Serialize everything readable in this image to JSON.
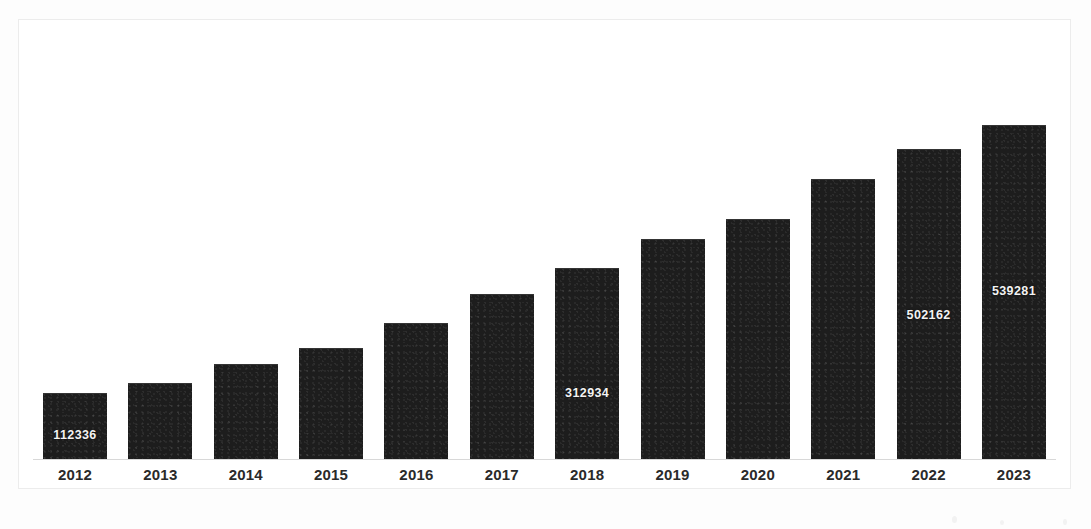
{
  "chart_data": {
    "type": "bar",
    "title": "",
    "subtitle": "",
    "xlabel": "",
    "ylabel": "",
    "grid": false,
    "legend": "none",
    "orientation": "vertical",
    "bar_color": "#1d1d1d",
    "value_label_color": "#f3f3f3",
    "categories": [
      "2012",
      "2013",
      "2014",
      "2015",
      "2016",
      "2017",
      "2018",
      "2019",
      "2020",
      "2021",
      "2022",
      "2023"
    ],
    "values": [
      112336,
      125000,
      156000,
      182000,
      222000,
      269000,
      312934,
      358000,
      390000,
      455000,
      502162,
      539281
    ],
    "ylim": [
      0,
      560000
    ],
    "value_labels": [
      {
        "category": "2012",
        "text": "112336",
        "shown": true
      },
      {
        "category": "2013",
        "text": "",
        "shown": false
      },
      {
        "category": "2014",
        "text": "",
        "shown": false
      },
      {
        "category": "2015",
        "text": "",
        "shown": false
      },
      {
        "category": "2016",
        "text": "",
        "shown": false
      },
      {
        "category": "2017",
        "text": "",
        "shown": false
      },
      {
        "category": "2018",
        "text": "312934",
        "shown": true
      },
      {
        "category": "2019",
        "text": "",
        "shown": false
      },
      {
        "category": "2020",
        "text": "",
        "shown": false
      },
      {
        "category": "2021",
        "text": "",
        "shown": false
      },
      {
        "category": "2022",
        "text": "502162",
        "shown": true
      },
      {
        "category": "2023",
        "text": "539281",
        "shown": true
      }
    ]
  },
  "bars": [
    {
      "year": "2012",
      "label": "112336",
      "label_shown": true,
      "height_px": 67,
      "label_bottom_px": 18
    },
    {
      "year": "2013",
      "label": "",
      "label_shown": false,
      "height_px": 77,
      "label_bottom_px": 18
    },
    {
      "year": "2014",
      "label": "",
      "label_shown": false,
      "height_px": 96,
      "label_bottom_px": 18
    },
    {
      "year": "2015",
      "label": "",
      "label_shown": false,
      "height_px": 112,
      "label_bottom_px": 18
    },
    {
      "year": "2016",
      "label": "",
      "label_shown": false,
      "height_px": 137,
      "label_bottom_px": 18
    },
    {
      "year": "2017",
      "label": "",
      "label_shown": false,
      "height_px": 166,
      "label_bottom_px": 18
    },
    {
      "year": "2018",
      "label": "312934",
      "label_shown": true,
      "height_px": 192,
      "label_bottom_px": 60
    },
    {
      "year": "2019",
      "label": "",
      "label_shown": false,
      "height_px": 221,
      "label_bottom_px": 18
    },
    {
      "year": "2020",
      "label": "",
      "label_shown": false,
      "height_px": 241,
      "label_bottom_px": 18
    },
    {
      "year": "2021",
      "label": "",
      "label_shown": false,
      "height_px": 281,
      "label_bottom_px": 18
    },
    {
      "year": "2022",
      "label": "502162",
      "label_shown": true,
      "height_px": 311,
      "label_bottom_px": 138
    },
    {
      "year": "2023",
      "label": "539281",
      "label_shown": true,
      "height_px": 335,
      "label_bottom_px": 162
    }
  ],
  "axis": {
    "ticks": [
      "2012",
      "2013",
      "2014",
      "2015",
      "2016",
      "2017",
      "2018",
      "2019",
      "2020",
      "2021",
      "2022",
      "2023"
    ]
  },
  "colors": {
    "bar": "#1d1d1d",
    "value_text": "#f3f3f3",
    "axis_text": "#2a2a2a",
    "axis_line": "#d8d8d8",
    "frame_border": "#ececec",
    "background": "#ffffff"
  }
}
